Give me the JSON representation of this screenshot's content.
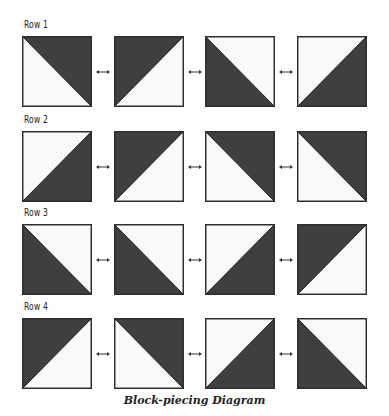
{
  "colors": {
    "dark": "#3f3f3f",
    "light": "#f9f9f9",
    "border": "#2e2e2e"
  },
  "rows": [
    {
      "label": "Row 1",
      "squares": [
        "upper-right",
        "upper-left",
        "lower-left",
        "lower-right"
      ]
    },
    {
      "label": "Row 2",
      "squares": [
        "lower-right",
        "upper-left",
        "upper-right",
        "upper-right"
      ]
    },
    {
      "label": "Row 3",
      "squares": [
        "lower-left",
        "lower-left",
        "lower-right",
        "upper-left"
      ]
    },
    {
      "label": "Row 4",
      "squares": [
        "upper-left",
        "upper-right",
        "lower-right",
        "lower-left"
      ]
    }
  ],
  "connector_icon": "double-arrow-icon",
  "caption": "Block-piecing Diagram"
}
